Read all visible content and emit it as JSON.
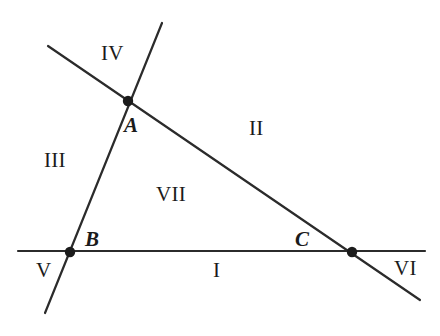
{
  "figure": {
    "background_color": "#ffffff",
    "stroke_color": "#2b2b2b",
    "point_fill_color": "#1b1b1b",
    "width": 440,
    "height": 336
  },
  "lines": [
    {
      "id": "line-horizontal",
      "name": "horizontal-line",
      "x1": 18,
      "y1": 251,
      "x2": 425,
      "y2": 251,
      "stroke_width": 2.2
    },
    {
      "id": "line-diagonal",
      "name": "descending-diagonal-line",
      "x1": 48,
      "y1": 46,
      "x2": 420,
      "y2": 300,
      "stroke_width": 2.2
    },
    {
      "id": "line-steep",
      "name": "steep-line",
      "x1": 162,
      "y1": 23,
      "x2": 45,
      "y2": 313,
      "stroke_width": 2.2
    }
  ],
  "points": [
    {
      "id": "point-a",
      "label": "A",
      "x": 128,
      "y": 101,
      "radius": 5.2
    },
    {
      "id": "point-b",
      "label": "B",
      "x": 70,
      "y": 252,
      "radius": 5.2
    },
    {
      "id": "point-c",
      "label": "C",
      "x": 352,
      "y": 252,
      "radius": 5.2
    }
  ],
  "regions": [
    {
      "id": "region-i",
      "label": "I",
      "description": "lower-middle region below horizontal line"
    },
    {
      "id": "region-ii",
      "label": "II",
      "description": "upper-right region"
    },
    {
      "id": "region-iii",
      "label": "III",
      "description": "left region"
    },
    {
      "id": "region-iv",
      "label": "IV",
      "description": "top region"
    },
    {
      "id": "region-v",
      "label": "V",
      "description": "lower-left region"
    },
    {
      "id": "region-vi",
      "label": "VI",
      "description": "lower-right region"
    },
    {
      "id": "region-vii",
      "label": "VII",
      "description": "central triangular region"
    }
  ]
}
